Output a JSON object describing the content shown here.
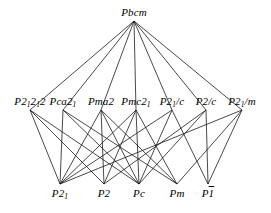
{
  "figure": {
    "type": "hasse-diagram",
    "width": 271,
    "height": 213,
    "background_color": "#ffffff",
    "line_color": "#1a1a1a"
  },
  "levels": {
    "top": {
      "index": 0,
      "y": 21,
      "label_y": 18,
      "nodes": [
        {
          "id": "Pbcm",
          "x": 134,
          "label_html": "Pbcm",
          "plain": "Pbcm"
        }
      ]
    },
    "middle": {
      "index": 1,
      "y": 110,
      "label_y": 107,
      "nodes": [
        {
          "id": "P2_12_12",
          "x": 30,
          "label_html": "P2<sub>1</sub>2<sub>1</sub>2",
          "plain": "P212 12"
        },
        {
          "id": "Pca2_1",
          "x": 63,
          "label_html": "Pca2<sub>1</sub>",
          "plain": "Pca21"
        },
        {
          "id": "Pma2",
          "x": 101,
          "label_html": "Pma2",
          "plain": "Pma2"
        },
        {
          "id": "Pmc2_1",
          "x": 136,
          "label_html": "Pmc2<sub>1</sub>",
          "plain": "Pmc21"
        },
        {
          "id": "P2_1_c",
          "x": 172,
          "label_html": "P2<sub>1</sub>/c",
          "plain": "P21/c"
        },
        {
          "id": "P2_c",
          "x": 206,
          "label_html": "P2/c",
          "plain": "P2/c"
        },
        {
          "id": "P2_1_m",
          "x": 242,
          "label_html": "P2<sub>1</sub>/m",
          "plain": "P21/m"
        }
      ]
    },
    "bottom": {
      "index": 2,
      "y": 184,
      "label_y": 199,
      "nodes": [
        {
          "id": "P2_1",
          "x": 60,
          "label_html": "P2<sub>1</sub>",
          "plain": "P21"
        },
        {
          "id": "P2",
          "x": 104,
          "label_html": "P2",
          "plain": "P2"
        },
        {
          "id": "Pc",
          "x": 139,
          "label_html": "Pc",
          "plain": "Pc"
        },
        {
          "id": "Pm",
          "x": 177,
          "label_html": "Pm",
          "plain": "Pm"
        },
        {
          "id": "P-1",
          "x": 208,
          "label_html": "P<span class=\"ovl\">1</span>",
          "plain": "P1bar"
        }
      ]
    }
  },
  "edges": [
    {
      "from": "Pbcm",
      "to": "P2_12_12"
    },
    {
      "from": "Pbcm",
      "to": "Pca2_1"
    },
    {
      "from": "Pbcm",
      "to": "Pma2"
    },
    {
      "from": "Pbcm",
      "to": "Pmc2_1"
    },
    {
      "from": "Pbcm",
      "to": "P2_1_c"
    },
    {
      "from": "Pbcm",
      "to": "P2_c"
    },
    {
      "from": "Pbcm",
      "to": "P2_1_m"
    },
    {
      "from": "P2_12_12",
      "to": "P2_1"
    },
    {
      "from": "P2_12_12",
      "to": "P2"
    },
    {
      "from": "P2_12_12",
      "to": "Pc"
    },
    {
      "from": "Pca2_1",
      "to": "P2_1"
    },
    {
      "from": "Pca2_1",
      "to": "Pc"
    },
    {
      "from": "Pca2_1",
      "to": "Pm"
    },
    {
      "from": "Pma2",
      "to": "P2_1"
    },
    {
      "from": "Pma2",
      "to": "P2"
    },
    {
      "from": "Pma2",
      "to": "Pc"
    },
    {
      "from": "Pma2",
      "to": "Pm"
    },
    {
      "from": "Pmc2_1",
      "to": "P2_1"
    },
    {
      "from": "Pmc2_1",
      "to": "P2"
    },
    {
      "from": "Pmc2_1",
      "to": "Pc"
    },
    {
      "from": "Pmc2_1",
      "to": "Pm"
    },
    {
      "from": "P2_1_c",
      "to": "P2_1"
    },
    {
      "from": "P2_1_c",
      "to": "Pc"
    },
    {
      "from": "P2_1_c",
      "to": "P-1"
    },
    {
      "from": "P2_c",
      "to": "P2"
    },
    {
      "from": "P2_c",
      "to": "Pc"
    },
    {
      "from": "P2_c",
      "to": "P-1"
    },
    {
      "from": "P2_1_m",
      "to": "P2_1"
    },
    {
      "from": "P2_1_m",
      "to": "Pm"
    },
    {
      "from": "P2_1_m",
      "to": "P-1"
    }
  ]
}
